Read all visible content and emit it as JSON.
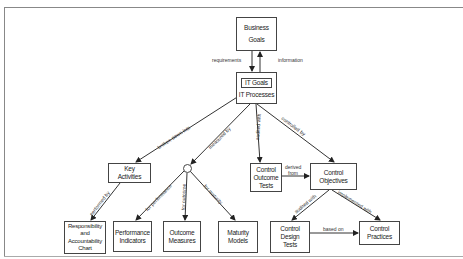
{
  "diagram": {
    "nodes": {
      "business_goals": {
        "line1": "Business",
        "line2": "Goals"
      },
      "it": {
        "inner": "IT Goals",
        "label": "IT Processes"
      },
      "key_activities": {
        "line1": "Key",
        "line2": "Activities"
      },
      "control_outcome_tests": {
        "line1": "Control",
        "line2": "Outcome",
        "line3": "Tests"
      },
      "control_objectives": {
        "line1": "Control",
        "line2": "Objectives"
      },
      "raci": {
        "line1": "Responsibility",
        "line2": "and",
        "line3": "Accountability",
        "line4": "Chart"
      },
      "performance_indicators": {
        "line1": "Performance",
        "line2": "Indicators"
      },
      "outcome_measures": {
        "line1": "Outcome",
        "line2": "Measures"
      },
      "maturity_models": {
        "line1": "Maturity",
        "line2": "Models"
      },
      "control_design_tests": {
        "line1": "Control",
        "line2": "Design",
        "line3": "Tests"
      },
      "control_practices": {
        "line1": "Control",
        "line2": "Practices"
      }
    },
    "edges": {
      "requirements": "requirements",
      "information": "information",
      "broken_down_into": "broken down into",
      "measured_by": "measured by",
      "audited_with": "audited with",
      "controlled_by": "controlled by",
      "derived_from_1": "derived",
      "derived_from_2": "from",
      "performed_by": "performed by",
      "for_performance": "for performance",
      "for_outcome": "for outcome",
      "for_maturity": "for maturity",
      "audited_with_2": "audited with",
      "implemented_with": "implemented with",
      "based_on": "based on"
    },
    "colors": {
      "line": "#333333",
      "box_border": "#444444",
      "frame": "#888888"
    }
  }
}
